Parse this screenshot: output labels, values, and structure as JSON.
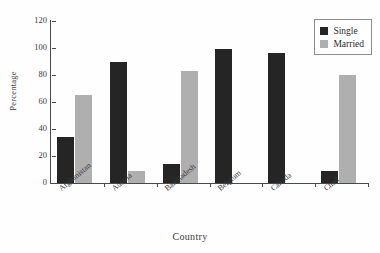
{
  "chart_data": {
    "type": "bar",
    "title": "",
    "xlabel": "Country",
    "ylabel": "Percentage",
    "categories": [
      "Afghanistan",
      "Austria",
      "Bangladesh",
      "Belgium",
      "Canada",
      "Chad"
    ],
    "series": [
      {
        "name": "Single",
        "color": "#252525",
        "values": [
          34,
          90,
          14,
          99,
          96,
          9
        ]
      },
      {
        "name": "Married",
        "color": "#afafaf",
        "values": [
          65,
          9,
          83,
          0,
          0,
          80
        ]
      }
    ],
    "ylim": [
      0,
      120
    ],
    "yticks": [
      0,
      20,
      40,
      60,
      80,
      100,
      120
    ],
    "grid": false,
    "legend_position": "top-right",
    "legend_entries": [
      "Single",
      "Married"
    ]
  }
}
